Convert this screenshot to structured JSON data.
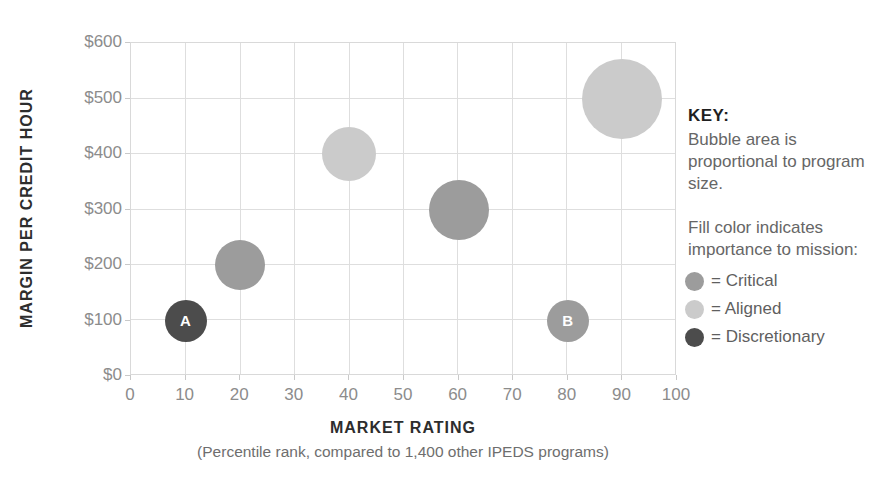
{
  "chart_data": {
    "type": "bubble",
    "title": "",
    "xlabel": "MARKET RATING",
    "xlabel_note": "(Percentile rank, compared to 1,400 other IPEDS programs)",
    "ylabel": "MARGIN PER CREDIT HOUR",
    "xlim": [
      0,
      100
    ],
    "ylim": [
      0,
      600
    ],
    "x_ticks": [
      0,
      10,
      20,
      30,
      40,
      50,
      60,
      70,
      80,
      90,
      100
    ],
    "y_ticks": [
      0,
      100,
      200,
      300,
      400,
      500,
      600
    ],
    "y_tick_labels": [
      "$0",
      "$100",
      "$200",
      "$300",
      "$400",
      "$500",
      "$600"
    ],
    "grid": true,
    "legend_position": "right",
    "colors": {
      "Critical": "#9c9c9c",
      "Aligned": "#cbcbcb",
      "Discretionary": "#4c4c4c"
    },
    "points": [
      {
        "label": "A",
        "x": 10,
        "y": 100,
        "radius_px": 21,
        "importance": "Discretionary"
      },
      {
        "label": "",
        "x": 20,
        "y": 200,
        "radius_px": 25,
        "importance": "Critical"
      },
      {
        "label": "",
        "x": 40,
        "y": 400,
        "radius_px": 27,
        "importance": "Aligned"
      },
      {
        "label": "",
        "x": 60,
        "y": 300,
        "radius_px": 30,
        "importance": "Critical"
      },
      {
        "label": "B",
        "x": 80,
        "y": 100,
        "radius_px": 21,
        "importance": "Critical"
      },
      {
        "label": "",
        "x": 90,
        "y": 500,
        "radius_px": 40,
        "importance": "Aligned"
      }
    ]
  },
  "key": {
    "heading": "KEY:",
    "para1": "Bubble area is proportional to program size.",
    "para2": "Fill color indicates importance to mission:",
    "entries": [
      {
        "color_key": "Critical",
        "label": "= Critical"
      },
      {
        "color_key": "Aligned",
        "label": "= Aligned"
      },
      {
        "color_key": "Discretionary",
        "label": "= Discretionary"
      }
    ]
  }
}
